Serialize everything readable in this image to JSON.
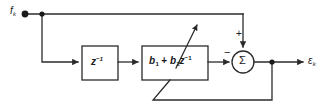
{
  "diagram": {
    "type": "signal-flow-block-diagram",
    "line_color": "#2b2b2b",
    "background": "#ffffff",
    "input": {
      "name": "input-signal",
      "symbol": "f",
      "subscript": "k",
      "label": "f_k"
    },
    "output": {
      "name": "output-error-signal",
      "symbol": "ε",
      "subscript": "k",
      "label": "ε_k"
    },
    "blocks": [
      {
        "id": "delay",
        "label_main": "z",
        "label_sup": "−1",
        "label": "z⁻¹",
        "x": 82,
        "y": 46,
        "w": 36,
        "h": 34
      },
      {
        "id": "adaptive-filter",
        "label": "b₁ + b₂z⁻¹",
        "coef1": "b",
        "coef1_sub": "1",
        "operator": "+",
        "coef2": "b",
        "coef2_sub": "2",
        "z_symbol": "z",
        "z_sup": "−1",
        "x": 142,
        "y": 46,
        "w": 66,
        "h": 34,
        "adaptive": true
      }
    ],
    "summer": {
      "id": "summing-junction",
      "symbol": "Σ",
      "cx": 243,
      "cy": 62,
      "r": 11,
      "signs": {
        "top_input": "+",
        "left_input": "−"
      }
    },
    "nodes": [
      {
        "id": "input-tap",
        "x": 42,
        "y": 14
      },
      {
        "id": "output-tap",
        "x": 272,
        "y": 62
      }
    ],
    "paths": {
      "feedforward_top": "input tap → right → down into summer (+)",
      "delay_branch": "input tap → down → right into z⁻¹",
      "series": "z⁻¹ → adaptive filter → summer (−)",
      "output": "summer → output tap → ε_k",
      "feedback": "output tap → down → left → diagonal up into adaptive filter"
    }
  }
}
